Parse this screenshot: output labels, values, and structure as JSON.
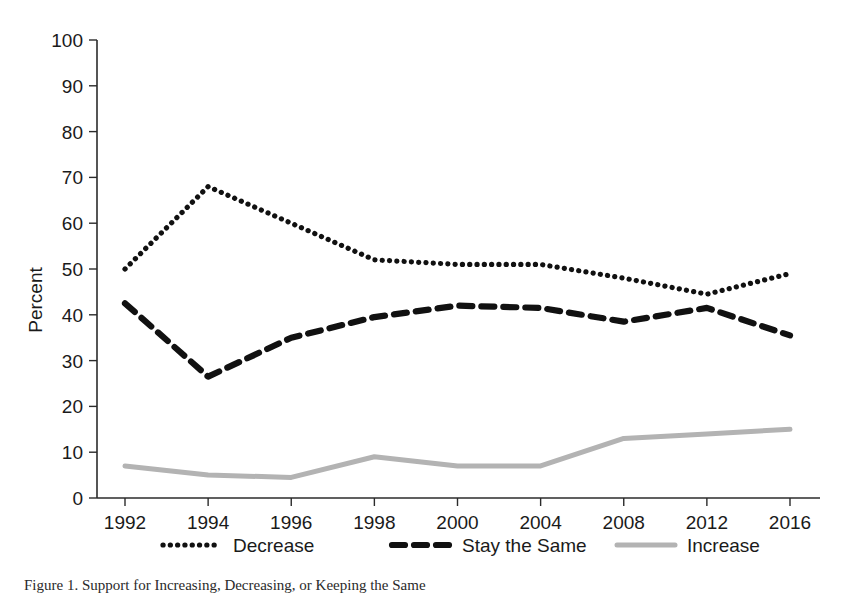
{
  "chart_data": {
    "type": "line",
    "title": "",
    "xlabel": "",
    "ylabel": "Percent",
    "categories": [
      "1992",
      "1994",
      "1996",
      "1998",
      "2000",
      "2004",
      "2008",
      "2012",
      "2016"
    ],
    "ylim": [
      0,
      100
    ],
    "yticks": [
      0,
      10,
      20,
      30,
      40,
      50,
      60,
      70,
      80,
      90,
      100
    ],
    "grid": false,
    "legend_position": "bottom",
    "series": [
      {
        "name": "Decrease",
        "style": "dotted",
        "color": "#111111",
        "values": [
          50,
          68,
          60,
          52,
          51,
          51,
          48,
          44.5,
          49
        ]
      },
      {
        "name": "Stay the Same",
        "style": "dashed",
        "color": "#111111",
        "values": [
          42.5,
          26.5,
          35,
          39.5,
          42,
          41.5,
          38.5,
          41.5,
          35.5
        ]
      },
      {
        "name": "Increase",
        "style": "solid",
        "color": "#b3b3b3",
        "values": [
          7,
          5,
          4.5,
          9,
          7,
          7,
          13,
          14,
          15
        ]
      }
    ]
  },
  "axis": {
    "y_title": "Percent",
    "y_tick_labels": [
      "100",
      "90",
      "80",
      "70",
      "60",
      "50",
      "40",
      "30",
      "20",
      "10",
      "0"
    ],
    "x_tick_labels": [
      "1992",
      "1994",
      "1996",
      "1998",
      "2000",
      "2004",
      "2008",
      "2012",
      "2016"
    ]
  },
  "legend": {
    "entries": [
      {
        "label": "Decrease",
        "marker": "dotted-line-swatch",
        "color": "#111111"
      },
      {
        "label": "Stay the Same",
        "marker": "dashed-line-swatch",
        "color": "#111111"
      },
      {
        "label": "Increase",
        "marker": "solid-line-swatch",
        "color": "#b3b3b3"
      }
    ]
  },
  "caption": {
    "text": "Figure 1. Support for Increasing, Decreasing, or Keeping the Same"
  }
}
